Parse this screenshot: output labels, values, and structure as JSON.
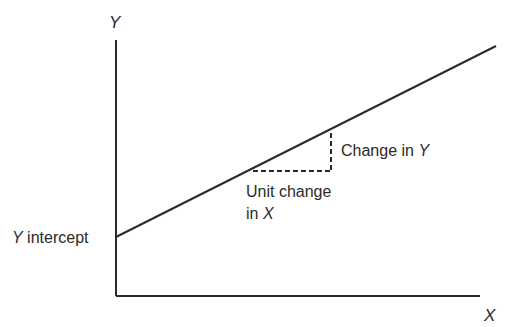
{
  "diagram": {
    "type": "linear-function-slope-illustration",
    "axes": {
      "y_label": "Y",
      "x_label": "X"
    },
    "labels": {
      "y_intercept": {
        "var": "Y",
        "text": " intercept"
      },
      "change_in_y": {
        "text": "Change in ",
        "var": "Y"
      },
      "unit_change_line1": "Unit change",
      "unit_change_line2": {
        "text": "in ",
        "var": "X"
      }
    },
    "geometry": {
      "origin": [
        116,
        296
      ],
      "y_axis_top": [
        116,
        40
      ],
      "x_axis_right": [
        480,
        296
      ],
      "line_start": [
        116,
        237
      ],
      "line_end": [
        496,
        46
      ],
      "dashed_horizontal": {
        "from": [
          253,
          171
        ],
        "to": [
          331,
          171
        ]
      },
      "dashed_vertical": {
        "from": [
          331,
          133
        ],
        "to": [
          331,
          171
        ]
      }
    },
    "colors": {
      "stroke": "#2a2a2a",
      "background": "#ffffff"
    }
  }
}
